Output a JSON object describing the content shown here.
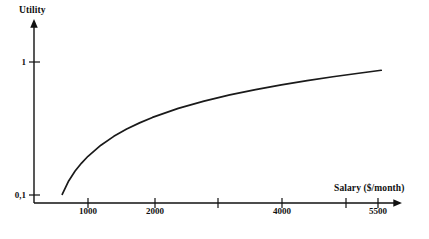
{
  "chart_data": {
    "type": "line",
    "title": "",
    "subtitle": "",
    "xlabel": "Salary ($/month)",
    "ylabel": "Utility",
    "xlim": [
      0,
      6000
    ],
    "ylim": [
      0,
      1.12
    ],
    "grid": false,
    "legend": null,
    "annotations": [],
    "x_ticks": [
      {
        "value": 1000,
        "label": "1000",
        "px": 88,
        "labeled": true
      },
      {
        "value": 2000,
        "label": "2000",
        "px": 155,
        "labeled": true
      },
      {
        "value": 3000,
        "label": "",
        "px": 218,
        "labeled": false
      },
      {
        "value": 4000,
        "label": "4000",
        "px": 282,
        "labeled": true
      },
      {
        "value": 5000,
        "label": "",
        "px": 346,
        "labeled": false
      },
      {
        "value": 5500,
        "label": "5500",
        "px": 378,
        "labeled": true
      }
    ],
    "y_ticks": [
      {
        "value": 1,
        "label": "1",
        "px": 62,
        "labeled": true
      },
      {
        "value": 0.1,
        "label": "0,1",
        "px": 195,
        "labeled": true
      }
    ],
    "series": [
      {
        "name": "Utility of salary",
        "shape": "concave increasing (logarithmic, diminishing returns)",
        "color": "#1a1a1a",
        "x": [
          600,
          700,
          800,
          900,
          1000,
          1200,
          1400,
          1600,
          1800,
          2000,
          2400,
          2800,
          3200,
          3600,
          4000,
          4400,
          4800,
          5200,
          5550
        ],
        "y": [
          0.105,
          0.195,
          0.262,
          0.316,
          0.362,
          0.437,
          0.497,
          0.546,
          0.588,
          0.625,
          0.686,
          0.735,
          0.777,
          0.813,
          0.845,
          0.874,
          0.9,
          0.924,
          0.944
        ]
      }
    ]
  },
  "axes": {
    "y_axis_name": "utility-axis",
    "x_axis_name": "salary-axis",
    "arrow_style": "solid filled triangle"
  }
}
